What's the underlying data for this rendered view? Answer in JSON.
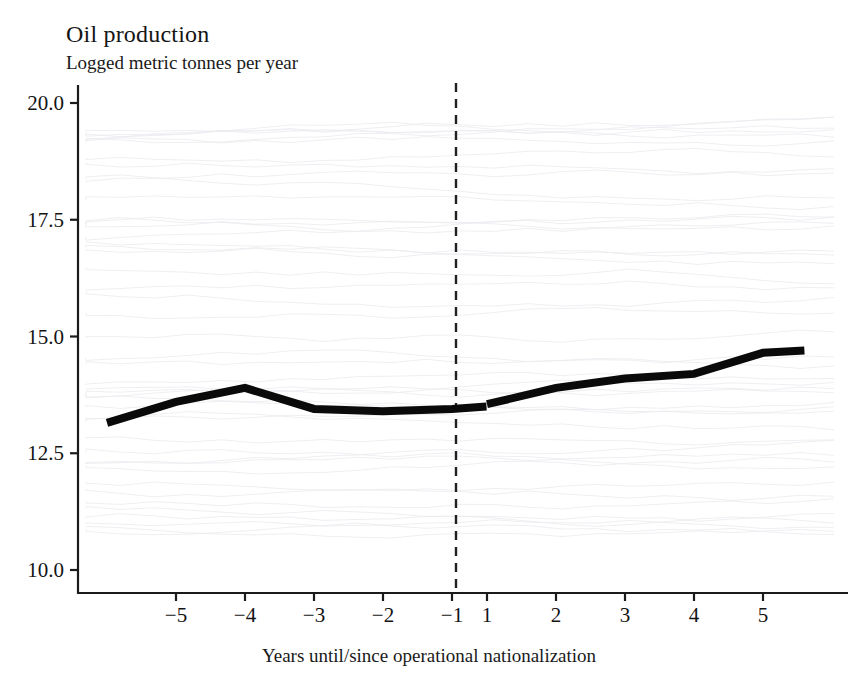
{
  "figure": {
    "title": "Oil production",
    "subtitle": "Logged metric tonnes per year",
    "xcaption": "Years until/since operational nationalization"
  },
  "chart_data": {
    "type": "line",
    "title": "Oil production",
    "subtitle": "Logged metric tonnes per year",
    "xlabel": "Years until/since operational nationalization",
    "ylabel": "Logged metric tonnes per year",
    "ylim": [
      10.0,
      20.0
    ],
    "xlim": [
      -6.0,
      6.0
    ],
    "grid": false,
    "legend": null,
    "y_ticks": [
      "10.0",
      "12.5",
      "15.0",
      "17.5",
      "20.0"
    ],
    "y_tick_values": [
      10.0,
      12.5,
      15.0,
      17.5,
      20.0
    ],
    "x_ticks": [
      "−5",
      "−4",
      "−3",
      "−2",
      "−1",
      "1",
      "2",
      "3",
      "4",
      "5"
    ],
    "x_tick_values": [
      -5,
      -4,
      -3,
      -2,
      -1,
      1,
      2,
      3,
      4,
      5
    ],
    "discontinuity_at": 0,
    "discontinuity_style": "dashed vertical line",
    "series": [
      {
        "name": "Mean logged oil production (pre-nationalization)",
        "x": [
          -6.0,
          -5,
          -4,
          -3,
          -2,
          -1,
          -0.5
        ],
        "values": [
          13.15,
          13.6,
          13.9,
          13.45,
          13.4,
          13.45,
          13.5
        ]
      },
      {
        "name": "Mean logged oil production (post-nationalization)",
        "x": [
          1,
          2,
          3,
          4,
          5,
          5.6
        ],
        "values": [
          13.55,
          13.9,
          14.1,
          14.2,
          14.65,
          14.7
        ]
      }
    ]
  }
}
